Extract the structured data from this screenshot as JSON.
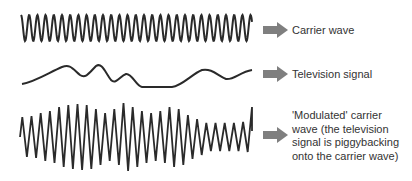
{
  "rows": [
    {
      "id": "carrier",
      "label": "Carrier wave"
    },
    {
      "id": "tv",
      "label": "Television signal"
    },
    {
      "id": "modulated",
      "label_lines": [
        "'Modulated' carrier",
        "wave (the television",
        "signal is piggybacking",
        "onto the carrier wave)"
      ]
    }
  ],
  "colors": {
    "wave": "#2a2a2a",
    "arrow": "#7f7f7f",
    "text": "#333333",
    "background": "#ffffff"
  },
  "icons": {
    "arrow": "right-arrow-icon"
  }
}
